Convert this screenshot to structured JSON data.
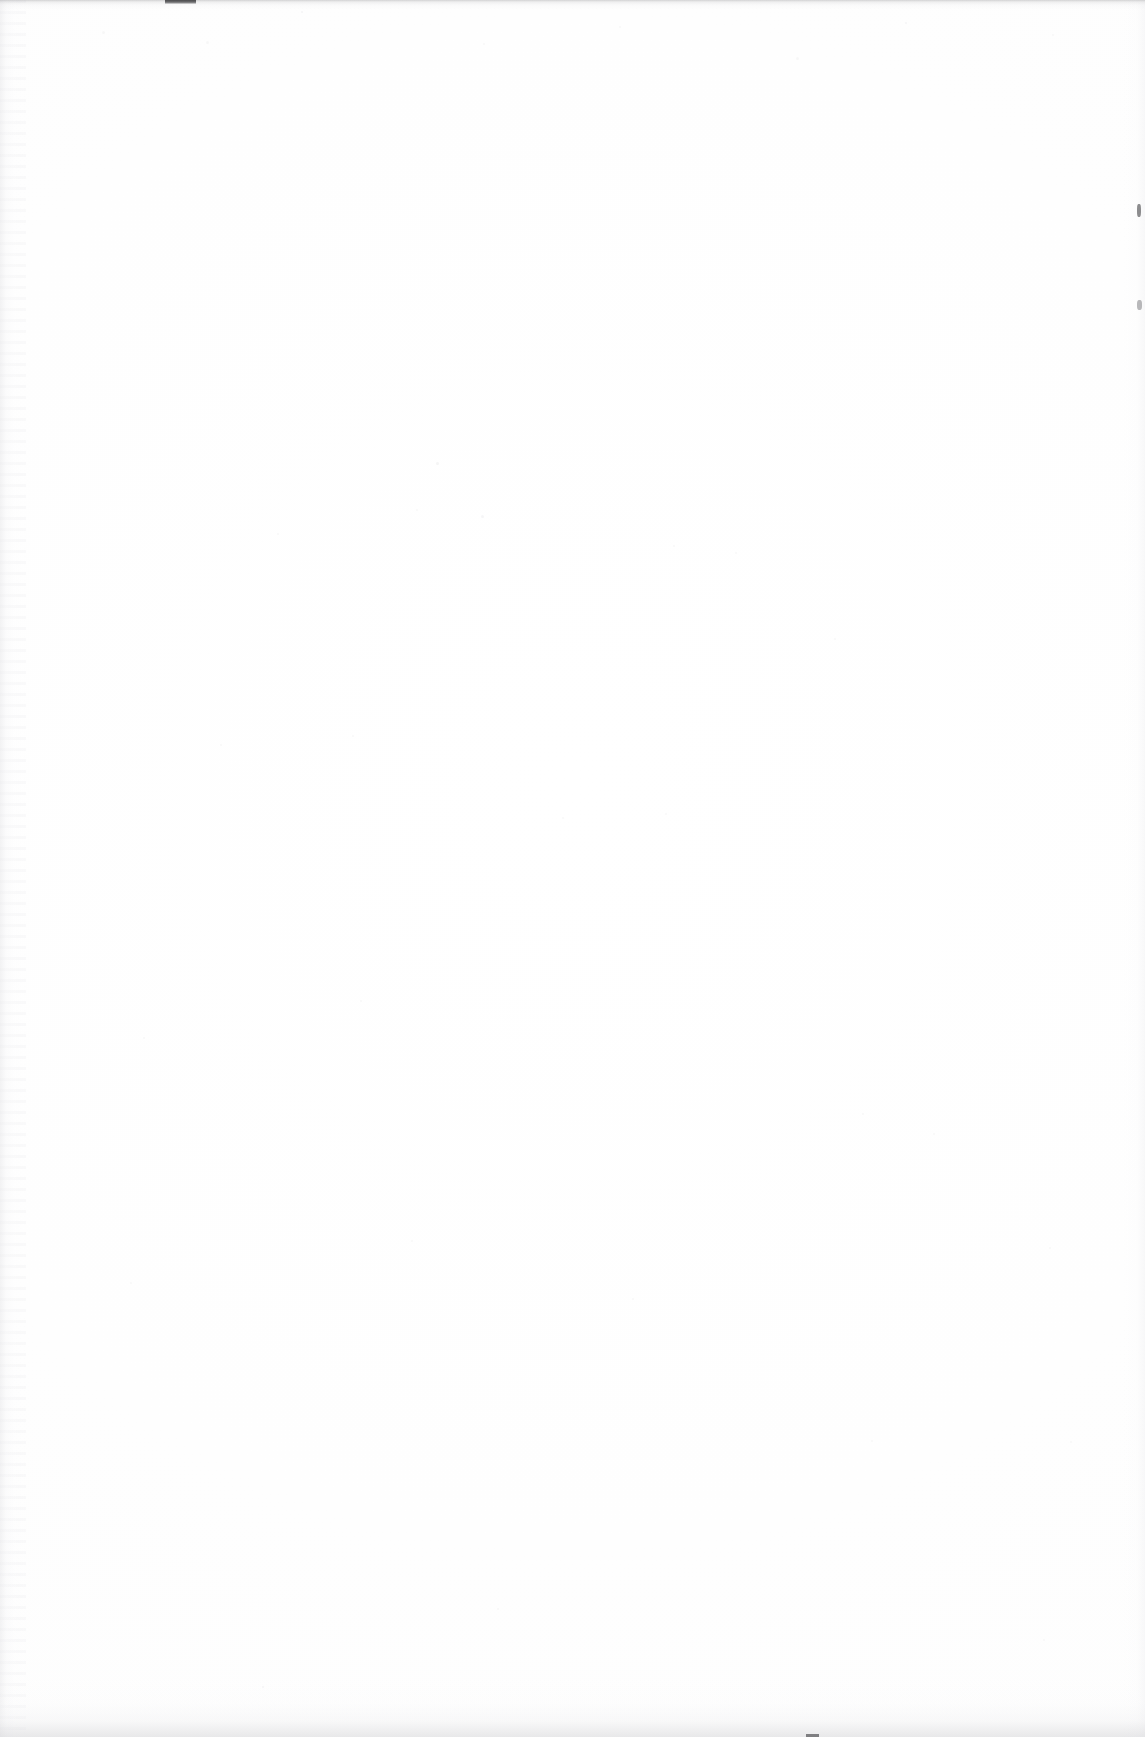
{
  "document": {
    "kind": "scanned-page",
    "orientation": "portrait",
    "width_px": 1145,
    "height_px": 1737,
    "content_text": "",
    "visible_text_blocks": [],
    "description": "Blank scanned paper page with no printed text, headings, figures or tables."
  },
  "colors": {
    "paper": "#fefefe",
    "paper_highlight": "#ffffff",
    "paper_shadow": "#fdfdfd",
    "edge_band": "#96969a",
    "edge_mark": "#4a4a4c",
    "fleck": "#5c5c60",
    "streak": "#e8e8ea",
    "bottom_shadow": "#d6d6d9"
  },
  "artifacts": [
    {
      "name": "top-edge-band",
      "type": "gray-band",
      "x": 0,
      "y": 0,
      "width": 1145,
      "height": 10
    },
    {
      "name": "top-edge-mark",
      "type": "dark-line-segment",
      "x": 165,
      "y": 0,
      "width": 31,
      "height": 4
    },
    {
      "name": "left-edge-streaks",
      "type": "vertical-scanner-streaks",
      "x": 0,
      "y": 0,
      "width": 26,
      "height": 1737
    },
    {
      "name": "right-edge-streaks",
      "type": "vertical-tone",
      "x": 1123,
      "y": 0,
      "width": 22,
      "height": 1737
    },
    {
      "name": "right-edge-fleck-upper",
      "type": "dark-speck",
      "x": 1137,
      "y": 204,
      "width": 4,
      "height": 13
    },
    {
      "name": "right-edge-fleck-lower",
      "type": "dark-speck",
      "x": 1137,
      "y": 300,
      "width": 5,
      "height": 10
    },
    {
      "name": "bottom-edge-shadow",
      "type": "gray-gradient",
      "x": 0,
      "y": 1679,
      "width": 1145,
      "height": 58
    },
    {
      "name": "bottom-edge-fleck",
      "type": "dark-speck",
      "x": 806,
      "y": 1734,
      "width": 13,
      "height": 3
    }
  ],
  "dust_specks": [
    {
      "x": 102,
      "y": 31,
      "size": 3,
      "opacity": 0.05
    },
    {
      "x": 206,
      "y": 41,
      "size": 3,
      "opacity": 0.05
    },
    {
      "x": 301,
      "y": 11,
      "size": 2,
      "opacity": 0.06
    },
    {
      "x": 436,
      "y": 462,
      "size": 3,
      "opacity": 0.07
    },
    {
      "x": 483,
      "y": 43,
      "size": 2,
      "opacity": 0.05
    },
    {
      "x": 619,
      "y": 26,
      "size": 2,
      "opacity": 0.05
    },
    {
      "x": 796,
      "y": 57,
      "size": 3,
      "opacity": 0.05
    },
    {
      "x": 905,
      "y": 22,
      "size": 2,
      "opacity": 0.06
    },
    {
      "x": 1052,
      "y": 34,
      "size": 2,
      "opacity": 0.05
    },
    {
      "x": 277,
      "y": 533,
      "size": 2,
      "opacity": 0.05
    },
    {
      "x": 416,
      "y": 509,
      "size": 2,
      "opacity": 0.05
    },
    {
      "x": 481,
      "y": 515,
      "size": 3,
      "opacity": 0.06
    },
    {
      "x": 673,
      "y": 545,
      "size": 2,
      "opacity": 0.05
    },
    {
      "x": 735,
      "y": 552,
      "size": 2,
      "opacity": 0.05
    },
    {
      "x": 834,
      "y": 638,
      "size": 2,
      "opacity": 0.05
    },
    {
      "x": 352,
      "y": 735,
      "size": 2,
      "opacity": 0.05
    },
    {
      "x": 220,
      "y": 744,
      "size": 2,
      "opacity": 0.05
    },
    {
      "x": 562,
      "y": 817,
      "size": 2,
      "opacity": 0.05
    },
    {
      "x": 665,
      "y": 813,
      "size": 2,
      "opacity": 0.05
    },
    {
      "x": 360,
      "y": 1000,
      "size": 2,
      "opacity": 0.05
    },
    {
      "x": 143,
      "y": 1037,
      "size": 2,
      "opacity": 0.05
    },
    {
      "x": 862,
      "y": 1113,
      "size": 2,
      "opacity": 0.05
    },
    {
      "x": 933,
      "y": 1133,
      "size": 2,
      "opacity": 0.05
    },
    {
      "x": 1049,
      "y": 1247,
      "size": 2,
      "opacity": 0.05
    },
    {
      "x": 411,
      "y": 1240,
      "size": 2,
      "opacity": 0.05
    },
    {
      "x": 632,
      "y": 1298,
      "size": 2,
      "opacity": 0.05
    },
    {
      "x": 130,
      "y": 1282,
      "size": 2,
      "opacity": 0.05
    },
    {
      "x": 871,
      "y": 1440,
      "size": 2,
      "opacity": 0.05
    },
    {
      "x": 1070,
      "y": 1441,
      "size": 2,
      "opacity": 0.05
    },
    {
      "x": 497,
      "y": 1608,
      "size": 2,
      "opacity": 0.05
    },
    {
      "x": 1043,
      "y": 1639,
      "size": 2,
      "opacity": 0.05
    },
    {
      "x": 262,
      "y": 1686,
      "size": 2,
      "opacity": 0.06
    }
  ]
}
